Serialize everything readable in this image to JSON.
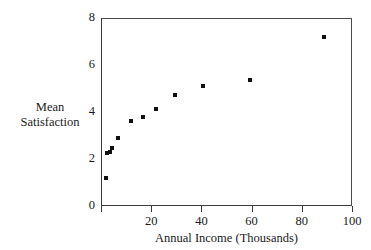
{
  "chart_data": {
    "type": "scatter",
    "title": "",
    "xlabel": "Annual Income (Thousands)",
    "ylabel_line1": "Mean",
    "ylabel_line2": "Satisfaction",
    "xlim": [
      0,
      100
    ],
    "ylim": [
      0,
      8
    ],
    "xticks": [
      0,
      20,
      40,
      60,
      80,
      100
    ],
    "xtick_labels": [
      "",
      "20",
      "40",
      "60",
      "80",
      "100"
    ],
    "yticks": [
      0,
      2,
      4,
      6,
      8
    ],
    "ytick_labels": [
      "0",
      "2",
      "4",
      "6",
      "8"
    ],
    "grid": false,
    "legend": null,
    "marker": "square",
    "marker_color": "#101010",
    "axis_color": "#3a3a3a",
    "background": "#ffffff",
    "points": [
      {
        "x": 1.5,
        "y": 1.25
      },
      {
        "x": 1.8,
        "y": 2.3
      },
      {
        "x": 3.0,
        "y": 2.35
      },
      {
        "x": 4.1,
        "y": 2.5
      },
      {
        "x": 6.4,
        "y": 2.95
      },
      {
        "x": 11.5,
        "y": 3.65
      },
      {
        "x": 16.5,
        "y": 3.85
      },
      {
        "x": 21.5,
        "y": 4.15
      },
      {
        "x": 29.0,
        "y": 4.75
      },
      {
        "x": 40.2,
        "y": 5.15
      },
      {
        "x": 59.0,
        "y": 5.4
      },
      {
        "x": 88.5,
        "y": 7.25
      }
    ]
  }
}
